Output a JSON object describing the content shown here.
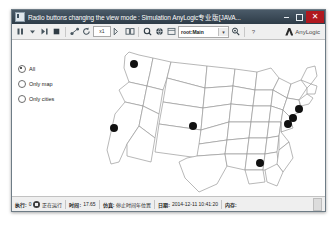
{
  "window": {
    "title": "Radio buttons changing the view mode : Simulation  AnyLogic专业版[JAVA...",
    "icon": "anylogic-app-icon",
    "controls": {
      "minimize": "minimize-button",
      "maximize": "maximize-button",
      "close": "close-button"
    }
  },
  "toolbar": {
    "items": [
      {
        "name": "pause-button",
        "glyph": "pause"
      },
      {
        "name": "run-dropdown",
        "glyph": "caret-down"
      },
      {
        "name": "step-button",
        "glyph": "step"
      },
      {
        "name": "stop-button",
        "glyph": "stop"
      },
      {
        "name": "navigate-root-button",
        "glyph": "node-link"
      },
      {
        "name": "refresh-button",
        "glyph": "refresh"
      },
      {
        "name": "zoom-level-field",
        "value": "x1"
      },
      {
        "name": "zoom-out-button",
        "glyph": "zoom-out"
      },
      {
        "name": "zoom-fit-button",
        "glyph": "zoom-fit"
      },
      {
        "name": "zoom-in-button",
        "glyph": "zoom-in"
      },
      {
        "name": "globe-button",
        "glyph": "globe"
      },
      {
        "name": "panel-button",
        "glyph": "panel"
      }
    ],
    "view_selector": {
      "value": "root:Main",
      "caret": "chevron-down-icon"
    },
    "locate-button": "locate-icon",
    "help-button": "?",
    "brand": "AnyLogic"
  },
  "canvas": {
    "view_mode_radios": [
      {
        "label": "All",
        "selected": true
      },
      {
        "label": "Only map",
        "selected": false
      },
      {
        "label": "Only cities",
        "selected": false
      }
    ],
    "map": {
      "name": "usa-map",
      "cities": [
        {
          "name": "Seattle",
          "x": 67,
          "y": 18
        },
        {
          "name": "San Francisco",
          "x": 47,
          "y": 82
        },
        {
          "name": "Denver",
          "x": 126,
          "y": 80
        },
        {
          "name": "Atlanta",
          "x": 193,
          "y": 117
        },
        {
          "name": "Washington DC",
          "x": 221,
          "y": 78
        },
        {
          "name": "Philadelphia",
          "x": 226,
          "y": 72
        },
        {
          "name": "New York",
          "x": 232,
          "y": 63
        }
      ]
    }
  },
  "status_bar": {
    "run_key": "执行:",
    "run_value": "0",
    "run_state": "正在运行",
    "time_key": "时间:",
    "time_value": "17.65",
    "sim_key": "仿真:",
    "sim_value": "停止时间年位置",
    "date_key": "日期:",
    "date_value": "2014-12-11 10:41:20",
    "memory_key": "内存:",
    "memory_value": ""
  },
  "colors": {
    "title_bar": "#2e3c48",
    "close_button": "#b0181f",
    "toolbar_bg": "#efefef",
    "canvas_bg": "#ffffff",
    "map_stroke": "#9a9a9a",
    "city_dot": "#111111"
  }
}
